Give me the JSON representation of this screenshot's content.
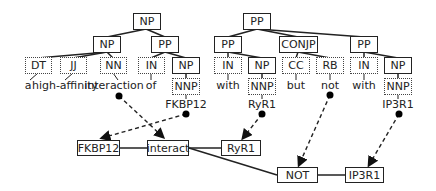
{
  "tree_left": {
    "root": "NP",
    "np": "NP",
    "pp": "PP",
    "tags": [
      "DT",
      "JJ",
      "NN",
      "IN",
      "NP"
    ],
    "words": [
      "a",
      "high-affinity",
      "interaction",
      "of"
    ],
    "nnp": "NNP",
    "entity": "FKBP12"
  },
  "tree_right": {
    "root": "PP",
    "pp1": "PP",
    "conjp": "CONJP",
    "pp2": "PP",
    "tags": [
      "IN",
      "NP",
      "CC",
      "RB",
      "IN",
      "NP"
    ],
    "words": [
      "with",
      "but",
      "not",
      "with"
    ],
    "nnp1": "NNP",
    "nnp2": "NNP",
    "entity1": "RyR1",
    "entity2": "IP3R1"
  },
  "graph": {
    "nodes": [
      "FKBP12",
      "interact",
      "RyR1",
      "NOT",
      "IP3R1"
    ]
  }
}
